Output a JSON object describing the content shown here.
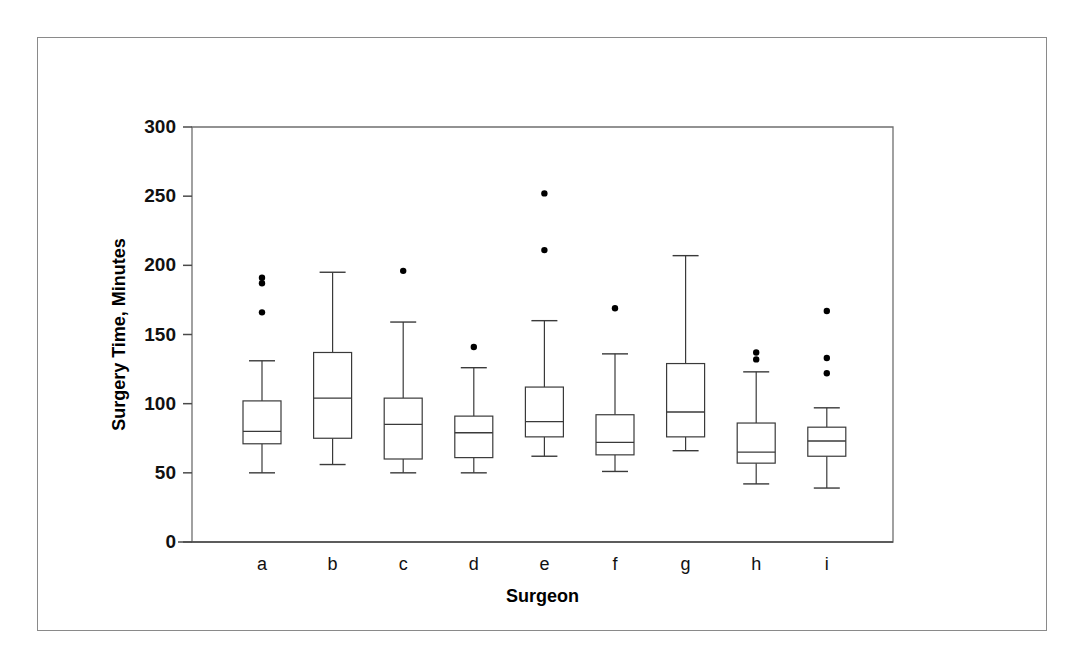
{
  "chart_data": {
    "type": "box",
    "title": "",
    "xlabel": "Surgeon",
    "ylabel": "Surgery Time, Minutes",
    "categories": [
      "a",
      "b",
      "c",
      "d",
      "e",
      "f",
      "g",
      "h",
      "i"
    ],
    "ylim": [
      0,
      300
    ],
    "yticks": [
      0,
      50,
      100,
      150,
      200,
      250,
      300
    ],
    "ytick_labels": [
      "0",
      "50",
      "100",
      "150",
      "200",
      "250",
      "300"
    ],
    "grid": false,
    "legend": "none",
    "boxes": [
      {
        "category": "a",
        "whisker_low": 50,
        "q1": 71,
        "median": 80,
        "q3": 102,
        "whisker_high": 131,
        "outliers": [
          191,
          187,
          166
        ]
      },
      {
        "category": "b",
        "whisker_low": 56,
        "q1": 75,
        "median": 104,
        "q3": 137,
        "whisker_high": 195,
        "outliers": []
      },
      {
        "category": "c",
        "whisker_low": 50,
        "q1": 60,
        "median": 85,
        "q3": 104,
        "whisker_high": 159,
        "outliers": [
          196
        ]
      },
      {
        "category": "d",
        "whisker_low": 50,
        "q1": 61,
        "median": 79,
        "q3": 91,
        "whisker_high": 126,
        "outliers": [
          141
        ]
      },
      {
        "category": "e",
        "whisker_low": 62,
        "q1": 76,
        "median": 87,
        "q3": 112,
        "whisker_high": 160,
        "outliers": [
          252,
          211
        ]
      },
      {
        "category": "f",
        "whisker_low": 51,
        "q1": 63,
        "median": 72,
        "q3": 92,
        "whisker_high": 136,
        "outliers": [
          169
        ]
      },
      {
        "category": "g",
        "whisker_low": 66,
        "q1": 76,
        "median": 94,
        "q3": 129,
        "whisker_high": 207,
        "outliers": []
      },
      {
        "category": "h",
        "whisker_low": 42,
        "q1": 57,
        "median": 65,
        "q3": 86,
        "whisker_high": 123,
        "outliers": [
          137,
          132
        ]
      },
      {
        "category": "i",
        "whisker_low": 39,
        "q1": 62,
        "median": 73,
        "q3": 83,
        "whisker_high": 97,
        "outliers": [
          167,
          133,
          122
        ]
      }
    ]
  },
  "colors": {
    "frame": "#8a8a8a",
    "axis": "#4a4a4a",
    "box_stroke": "#3a3a3a",
    "outlier": "#000000",
    "background": "#ffffff"
  }
}
